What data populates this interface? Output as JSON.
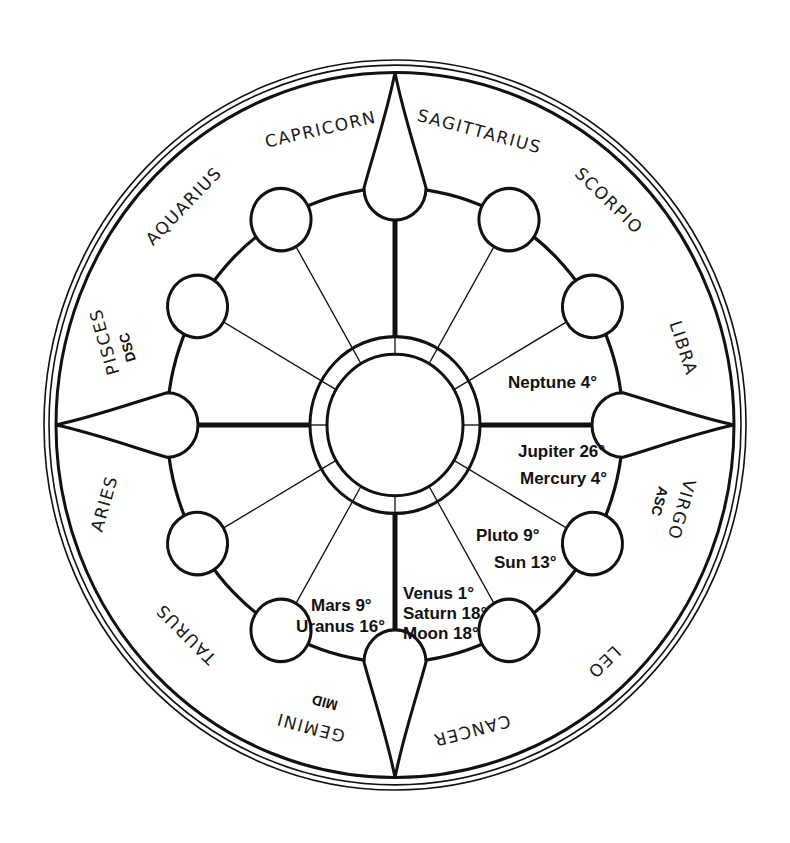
{
  "chart": {
    "center": {
      "x": 395,
      "y": 425
    },
    "colors": {
      "ink": "#111111",
      "background": "#ffffff"
    }
  },
  "signs": [
    {
      "name": "CAPRICORN",
      "angle": -104
    },
    {
      "name": "SAGITTARIUS",
      "angle": -74
    },
    {
      "name": "SCORPIO",
      "angle": -45
    },
    {
      "name": "LIBRA",
      "angle": -16
    },
    {
      "name": "VIRGO",
      "angle": 16,
      "tag": "ASC"
    },
    {
      "name": "LEO",
      "angle": 45
    },
    {
      "name": "CANCER",
      "angle": 74
    },
    {
      "name": "GEMINI",
      "angle": 104,
      "tag": "MID"
    },
    {
      "name": "TAURUS",
      "angle": 135
    },
    {
      "name": "ARIES",
      "angle": 164
    },
    {
      "name": "PISCES",
      "angle": 196,
      "tag": "DSC"
    },
    {
      "name": "AQUARIUS",
      "angle": 225
    }
  ],
  "tags": {
    "asc": "ASC",
    "mid": "MID",
    "dsc": "DSC"
  },
  "placements": [
    {
      "group": "neptune",
      "lines": [
        "Neptune 4°"
      ]
    },
    {
      "group": "jupiter-mercury",
      "lines": [
        "Jupiter 26°",
        "Mercury 4°"
      ]
    },
    {
      "group": "pluto-sun",
      "lines": [
        "Pluto 9°",
        "Sun 13°"
      ]
    },
    {
      "group": "venus-saturn-moon",
      "lines": [
        "Venus 1°",
        "Saturn 18°",
        "Moon 18°"
      ]
    },
    {
      "group": "mars-uranus",
      "lines": [
        "Mars 9°",
        "Uranus 16°"
      ]
    }
  ]
}
